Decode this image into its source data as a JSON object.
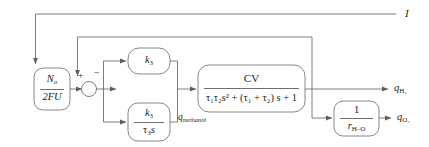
{
  "diagram": {
    "type": "block-diagram",
    "background_color": "#ffffff",
    "line_color": "#6f6f6f",
    "text_color": "#1a1a1a"
  },
  "blocks": {
    "input_gain": {
      "name": "N_o/2FU",
      "numerator": "N",
      "numerator_sub": "o",
      "denominator": "2FU"
    },
    "proportional": {
      "name": "k3",
      "symbol": "k",
      "symbol_sub": "3"
    },
    "integral": {
      "name": "k3 / tau3 s",
      "numerator": "k",
      "numerator_sub": "3",
      "denominator": "τ",
      "denominator_sub": "3",
      "denominator_tail": "s"
    },
    "plant": {
      "name": "CV transfer function",
      "numerator": "CV",
      "denominator_prefix": "τ",
      "denominator": "τ₁τ₂s² + (τ₁ + τ₂) s + 1"
    },
    "oxygen_ratio": {
      "name": "1 / r H-O",
      "numerator": "1",
      "denominator": "r",
      "denominator_sub": "H–O"
    }
  },
  "signals": {
    "current": "I",
    "methanol_flow": "q",
    "methanol_flow_sub": "methanol",
    "hydrogen_out": "q",
    "hydrogen_out_sub": "H₂",
    "oxygen_out": "q",
    "oxygen_out_sub": "O₂"
  },
  "summing_junction": {
    "name": "summing-junction",
    "plus_sign": "+",
    "minus_sign": "−"
  }
}
